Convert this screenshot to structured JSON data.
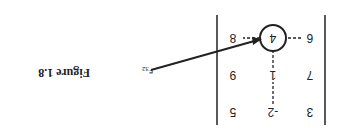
{
  "figure": {
    "caption": "Figure 1.8",
    "orientation": "rotated 180 degrees"
  },
  "matrix": {
    "rows": [
      [
        "3",
        "-2",
        "5"
      ],
      [
        "7",
        "1",
        "9"
      ],
      [
        "6",
        "4",
        "8"
      ]
    ],
    "highlighted": {
      "row": 3,
      "col": 2,
      "value": "4"
    }
  },
  "annotation": {
    "label": "e",
    "subscript": "32"
  }
}
